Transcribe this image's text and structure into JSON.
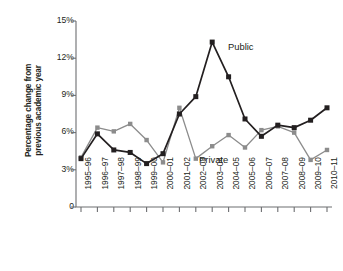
{
  "chart_data": {
    "type": "line",
    "title": "",
    "subtitle": "",
    "xlabel": "",
    "ylabel": "Percentage change from\nprevious academic year",
    "categories": [
      "1995–96",
      "1996–97",
      "1997–98",
      "1998–99",
      "1999–00",
      "2000–01",
      "2001–02",
      "2002–03",
      "2003–04",
      "2004–05",
      "2005–06",
      "2006–07",
      "2007–08",
      "2008–09",
      "2009–10",
      "2010–11"
    ],
    "ylim": [
      0,
      15
    ],
    "ytick_values": [
      0,
      3,
      6,
      9,
      12,
      15
    ],
    "ytick_labels": [
      "0",
      "3%",
      "6%",
      "9%",
      "12%",
      "15%"
    ],
    "grid": false,
    "legend_position": "inline-annotation",
    "series": [
      {
        "name": "Public",
        "color": "#231f20",
        "marker": "square",
        "values": [
          3.9,
          5.9,
          4.6,
          4.4,
          3.5,
          4.3,
          7.5,
          8.9,
          13.3,
          10.5,
          7.1,
          5.7,
          6.6,
          6.4,
          7.0,
          8.0
        ]
      },
      {
        "name": "Private",
        "color": "#8c8c8c",
        "marker": "square",
        "values": [
          4.0,
          6.4,
          6.1,
          6.7,
          5.4,
          3.6,
          8.0,
          3.9,
          4.9,
          5.8,
          4.8,
          6.2,
          6.5,
          6.0,
          3.8,
          4.6
        ]
      }
    ],
    "annotations": [
      {
        "text": "Public",
        "series": "Public"
      },
      {
        "text": "Private",
        "series": "Private"
      }
    ]
  },
  "axis": {
    "y_title": "Percentage change from\nprevious academic year",
    "y_labels": [
      "15%",
      "12%",
      "9%",
      "6%",
      "3%",
      "0"
    ]
  },
  "labels": {
    "public": "Public",
    "private": "Private"
  }
}
